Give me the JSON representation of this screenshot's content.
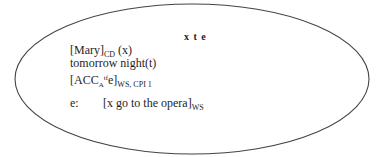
{
  "diagram": {
    "type": "DRS-style box (ellipse)",
    "stroke_color": "#444444",
    "discourse_referents": "x t e",
    "conditions": [
      {
        "id": "mary",
        "main": "[Mary]",
        "subscript": "CD",
        "tail": " (x)"
      },
      {
        "id": "tomorrow",
        "main": "tomorrow night(t)"
      },
      {
        "id": "acc",
        "open": "[ACC",
        "subscript_a": "A",
        "superscript": "tf",
        "mid": "e]",
        "subscript": "WS, CPI 1"
      },
      {
        "id": "event",
        "label": "e:",
        "main": "[x go to the opera]",
        "subscript": "WS"
      }
    ]
  }
}
